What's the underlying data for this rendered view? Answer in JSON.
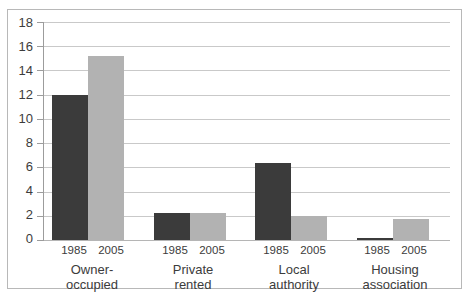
{
  "chart_data": {
    "type": "bar",
    "title": "",
    "subtitle": "",
    "xlabel": "",
    "ylabel": "",
    "ylim": [
      0,
      18
    ],
    "ytick_step": 2,
    "yticks": [
      "18",
      "16",
      "14",
      "12",
      "10",
      "8",
      "6",
      "4",
      "2",
      "0"
    ],
    "grid": true,
    "legend": "none",
    "categories": [
      "Owner-occupied",
      "Private rented",
      "Local authority",
      "Housing association"
    ],
    "category_lines": [
      [
        "Owner-",
        "occupied"
      ],
      [
        "Private",
        "rented"
      ],
      [
        "Local",
        "authority"
      ],
      [
        "Housing",
        "association"
      ]
    ],
    "series": [
      {
        "name": "1985",
        "color": "#3b3b3b",
        "values": [
          12.0,
          2.25,
          6.4,
          0.2
        ]
      },
      {
        "name": "2005",
        "color": "#b2b2b2",
        "values": [
          15.2,
          2.25,
          2.0,
          1.7
        ]
      }
    ],
    "series_labels": [
      "1985",
      "2005"
    ]
  },
  "axis": {
    "tick_18": "18",
    "tick_16": "16",
    "tick_14": "14",
    "tick_12": "12",
    "tick_10": "10",
    "tick_8": "8",
    "tick_6": "6",
    "tick_4": "4",
    "tick_2": "2",
    "tick_0": "0"
  },
  "groups": [
    {
      "line1": "Owner-",
      "line2": "occupied",
      "year1": "1985",
      "year2": "2005"
    },
    {
      "line1": "Private",
      "line2": "rented",
      "year1": "1985",
      "year2": "2005"
    },
    {
      "line1": "Local",
      "line2": "authority",
      "year1": "1985",
      "year2": "2005"
    },
    {
      "line1": "Housing",
      "line2": "association",
      "year1": "1985",
      "year2": "2005"
    }
  ],
  "colors": {
    "bar_1985": "#3b3b3b",
    "bar_2005": "#b2b2b2",
    "grid": "#c9c9c9",
    "frame": "#b8b8b8",
    "text": "#3c3c3c"
  }
}
